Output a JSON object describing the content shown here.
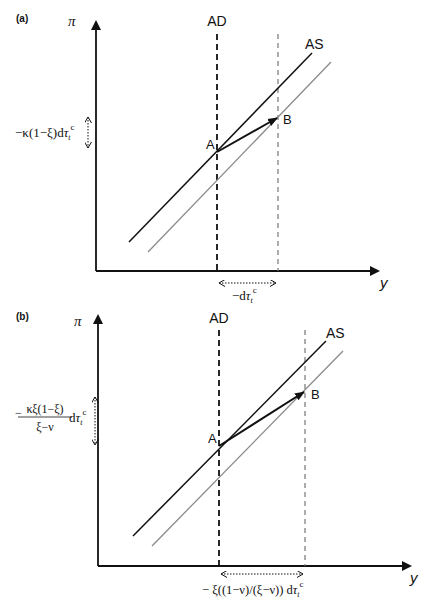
{
  "panels": [
    {
      "id": "a",
      "panel_label": "(a)",
      "y_axis_label": "π",
      "x_axis_label": "y",
      "ad_label": "AD",
      "as_label": "AS",
      "point_a_label": "A",
      "point_b_label": "B",
      "y_change_label_main": "−κ(1−ξ)d",
      "y_change_label_tau": "τ",
      "y_change_label_sub": "t",
      "y_change_label_sup": "c",
      "x_change_label_main": "−d",
      "x_change_label_tau": "τ",
      "x_change_label_sub": "t",
      "x_change_label_sup": "c"
    },
    {
      "id": "b",
      "panel_label": "(b)",
      "y_axis_label": "π",
      "x_axis_label": "y",
      "ad_label": "AD",
      "as_label": "AS",
      "point_a_label": "A",
      "point_b_label": "B",
      "y_change_label_numerator": "κξ(1−ξ)",
      "y_change_label_denominator": "ξ−ν",
      "y_change_label_prefix": "−",
      "y_change_label_d": "d",
      "y_change_label_tau": "τ",
      "y_change_label_sub": "t",
      "y_change_label_sup": "c",
      "x_change_label_main": "− ξ((1−ν)/(ξ−ν)) d",
      "x_change_label_tau": "τ",
      "x_change_label_sub": "t",
      "x_change_label_sup": "c"
    }
  ],
  "colors": {
    "axis": "#111111",
    "as_curve": "#111111",
    "as_shifted_curve": "#8a8a8a",
    "ad_line": "#111111",
    "new_equilibrium_line": "#777777",
    "arrow": "#111111"
  }
}
